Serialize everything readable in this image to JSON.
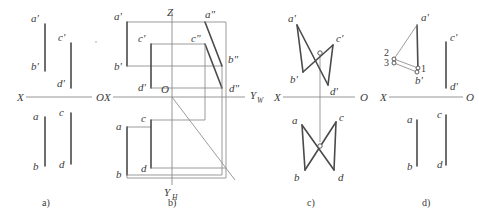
{
  "figure": {
    "background_color": "#ffffff",
    "line_color": "#4a4a4a",
    "thin_line_color": "#8a8a8a",
    "width": 479,
    "height": 219
  },
  "panels": [
    {
      "id": "a",
      "caption": "a)",
      "axis": {
        "left_label": "X",
        "right_label": "O"
      },
      "labels": [
        {
          "key": "a_prime",
          "text": "a'"
        },
        {
          "key": "b_prime",
          "text": "b'"
        },
        {
          "key": "c_prime",
          "text": "c'"
        },
        {
          "key": "d_prime",
          "text": "d'"
        },
        {
          "key": "a",
          "text": "a"
        },
        {
          "key": "b",
          "text": "b"
        },
        {
          "key": "c",
          "text": "c"
        },
        {
          "key": "d",
          "text": "d"
        }
      ]
    },
    {
      "id": "b",
      "caption": "b)",
      "axis": {
        "left_label": "X",
        "right_label": "Y",
        "right_label_sub": "W",
        "vertical_up_label": "Z",
        "vertical_down_label": "Y",
        "vertical_down_label_sub": "H",
        "origin_label": "O"
      },
      "labels": [
        {
          "key": "a_prime",
          "text": "a'"
        },
        {
          "key": "b_prime",
          "text": "b'"
        },
        {
          "key": "c_prime",
          "text": "c'"
        },
        {
          "key": "d_prime",
          "text": "d'"
        },
        {
          "key": "a_dprime",
          "text": "a\""
        },
        {
          "key": "b_dprime",
          "text": "b\""
        },
        {
          "key": "c_dprime",
          "text": "c\""
        },
        {
          "key": "d_dprime",
          "text": "d\""
        },
        {
          "key": "a",
          "text": "a"
        },
        {
          "key": "b",
          "text": "b"
        },
        {
          "key": "c",
          "text": "c"
        },
        {
          "key": "d",
          "text": "d"
        }
      ]
    },
    {
      "id": "c",
      "caption": "c)",
      "axis": {
        "left_label": "X",
        "right_label": "O"
      },
      "labels": [
        {
          "key": "a_prime",
          "text": "a'"
        },
        {
          "key": "b_prime",
          "text": "b'"
        },
        {
          "key": "c_prime",
          "text": "c'"
        },
        {
          "key": "d_prime",
          "text": "d'"
        },
        {
          "key": "a",
          "text": "a"
        },
        {
          "key": "b",
          "text": "b"
        },
        {
          "key": "c",
          "text": "c"
        },
        {
          "key": "d",
          "text": "d"
        }
      ]
    },
    {
      "id": "d",
      "caption": "d)",
      "axis": {
        "left_label": "X",
        "right_label": "O"
      },
      "labels": [
        {
          "key": "a_prime",
          "text": "a'"
        },
        {
          "key": "b_prime",
          "text": "b'"
        },
        {
          "key": "c_prime",
          "text": "c'"
        },
        {
          "key": "d_prime",
          "text": "d'"
        },
        {
          "key": "a",
          "text": "a"
        },
        {
          "key": "b",
          "text": "b"
        },
        {
          "key": "c",
          "text": "c"
        },
        {
          "key": "d",
          "text": "d"
        },
        {
          "key": "point_1",
          "text": "1"
        },
        {
          "key": "point_2",
          "text": "2"
        },
        {
          "key": "point_3",
          "text": "3"
        }
      ]
    }
  ]
}
